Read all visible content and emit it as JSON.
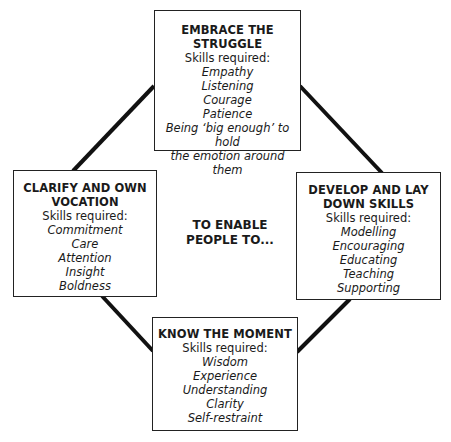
{
  "diagram": {
    "center_label": [
      "TO ENABLE",
      "PEOPLE TO..."
    ],
    "nodes": {
      "top": {
        "title": [
          "EMBRACE THE",
          "STRUGGLE"
        ],
        "subtitle": "Skills required:",
        "skills": [
          "Empathy",
          "Listening",
          "Courage",
          "Patience",
          "Being ‘big enough’ to hold",
          "the emotion around them"
        ]
      },
      "left": {
        "title": [
          "CLARIFY AND OWN",
          "VOCATION"
        ],
        "subtitle": "Skills required:",
        "skills": [
          "Commitment",
          "Care",
          "Attention",
          "Insight",
          "Boldness"
        ]
      },
      "right": {
        "title": [
          "DEVELOP AND LAY",
          "DOWN SKILLS"
        ],
        "subtitle": "Skills required:",
        "skills": [
          "Modelling",
          "Encouraging",
          "Educating",
          "Teaching",
          "Supporting"
        ]
      },
      "bottom": {
        "title": [
          "KNOW THE MOMENT"
        ],
        "subtitle": "Skills required:",
        "skills": [
          "Wisdom",
          "Experience",
          "Understanding",
          "Clarity",
          "Self-restraint"
        ]
      }
    },
    "connections": [
      {
        "from": "top",
        "to": "left"
      },
      {
        "from": "top",
        "to": "right"
      },
      {
        "from": "left",
        "to": "bottom"
      },
      {
        "from": "right",
        "to": "bottom"
      }
    ]
  }
}
